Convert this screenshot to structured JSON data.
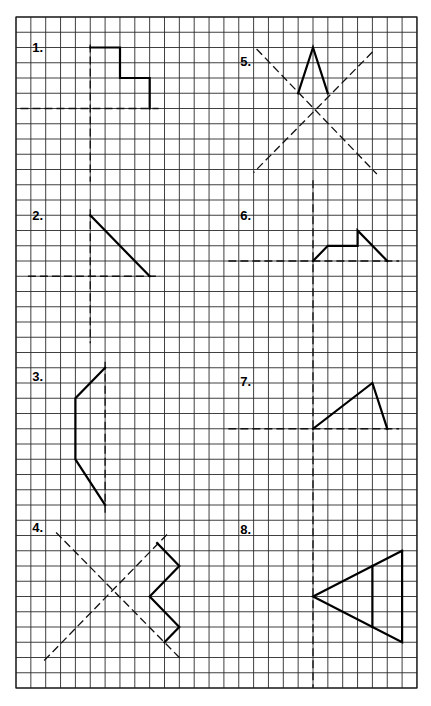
{
  "worksheet": {
    "grid": {
      "origin_px": [
        16,
        17
      ],
      "cell_w": 14.85,
      "cell_h": 15.25,
      "cols": 27,
      "rows": 44,
      "line_color": "#2a2a2a"
    },
    "exercises": [
      {
        "id": "1",
        "label": "1.",
        "label_pos": [
          1.1,
          2.3
        ],
        "axes": [
          [
            [
              0.3,
              6
            ],
            [
              9.6,
              6
            ]
          ],
          [
            [
              5,
              1.8
            ],
            [
              5,
              10.8
            ]
          ]
        ],
        "shapes": [
          [
            [
              5,
              2
            ],
            [
              7,
              2
            ],
            [
              7,
              4
            ],
            [
              9,
              4
            ],
            [
              9,
              6
            ]
          ]
        ]
      },
      {
        "id": "2",
        "label": "2.",
        "label_pos": [
          1.1,
          13.3
        ],
        "axes": [
          [
            [
              0.8,
              17
            ],
            [
              9.7,
              17
            ]
          ],
          [
            [
              5,
              12.6
            ],
            [
              5,
              21.4
            ]
          ]
        ],
        "shapes": [
          [
            [
              5,
              13
            ],
            [
              9,
              17
            ]
          ]
        ]
      },
      {
        "id": "3",
        "label": "3.",
        "label_pos": [
          1.1,
          23.9
        ],
        "axes": [
          [
            [
              6,
              22.6
            ],
            [
              6,
              32.5
            ]
          ]
        ],
        "shapes": [
          [
            [
              6,
              23
            ],
            [
              4,
              25
            ],
            [
              4,
              29
            ],
            [
              6,
              32
            ]
          ]
        ]
      },
      {
        "id": "4",
        "label": "4.",
        "label_pos": [
          1.1,
          33.8
        ],
        "axes": [
          [
            [
              2.7,
              33.8
            ],
            [
              11.2,
              42.2
            ]
          ],
          [
            [
              1.9,
              42.2
            ],
            [
              10.3,
              33.8
            ]
          ]
        ],
        "shapes": [
          [
            [
              9.5,
              34.5
            ],
            [
              11,
              36
            ],
            [
              9,
              38
            ],
            [
              11,
              40
            ],
            [
              10,
              41
            ]
          ]
        ]
      },
      {
        "id": "5",
        "label": "5.",
        "label_pos": [
          15.1,
          3.2
        ],
        "axes": [
          [
            [
              16.2,
              2.1
            ],
            [
              24.3,
              10.3
            ]
          ],
          [
            [
              24,
              2.3
            ],
            [
              16,
              10.2
            ]
          ]
        ],
        "shapes": [
          [
            [
              19,
              5
            ],
            [
              20,
              2
            ],
            [
              21,
              5
            ]
          ]
        ]
      },
      {
        "id": "6",
        "label": "6.",
        "label_pos": [
          15.1,
          13.3
        ],
        "axes": [
          [
            [
              14.3,
              16
            ],
            [
              25.8,
              16
            ]
          ]
        ],
        "shapes": [
          [
            [
              20,
              16
            ],
            [
              21,
              15
            ],
            [
              23,
              15
            ],
            [
              23,
              14
            ],
            [
              25,
              16
            ]
          ]
        ]
      },
      {
        "id": "7",
        "label": "7.",
        "label_pos": [
          15.1,
          24.2
        ],
        "axes": [
          [
            [
              14.3,
              27
            ],
            [
              25.8,
              27
            ]
          ]
        ],
        "shapes": [
          [
            [
              20,
              27
            ],
            [
              24,
              24
            ],
            [
              25,
              27
            ]
          ]
        ]
      },
      {
        "id": "8",
        "label": "8.",
        "label_pos": [
          15.1,
          33.9
        ],
        "axes": [],
        "shapes": [
          [
            [
              26,
              35
            ],
            [
              20,
              38
            ],
            [
              26,
              41
            ],
            [
              26,
              35
            ]
          ],
          [
            [
              24,
              36
            ],
            [
              24,
              40
            ]
          ]
        ]
      }
    ],
    "shared_axes": [
      [
        [
          20,
          10.7
        ],
        [
          20,
          44
        ]
      ]
    ]
  }
}
